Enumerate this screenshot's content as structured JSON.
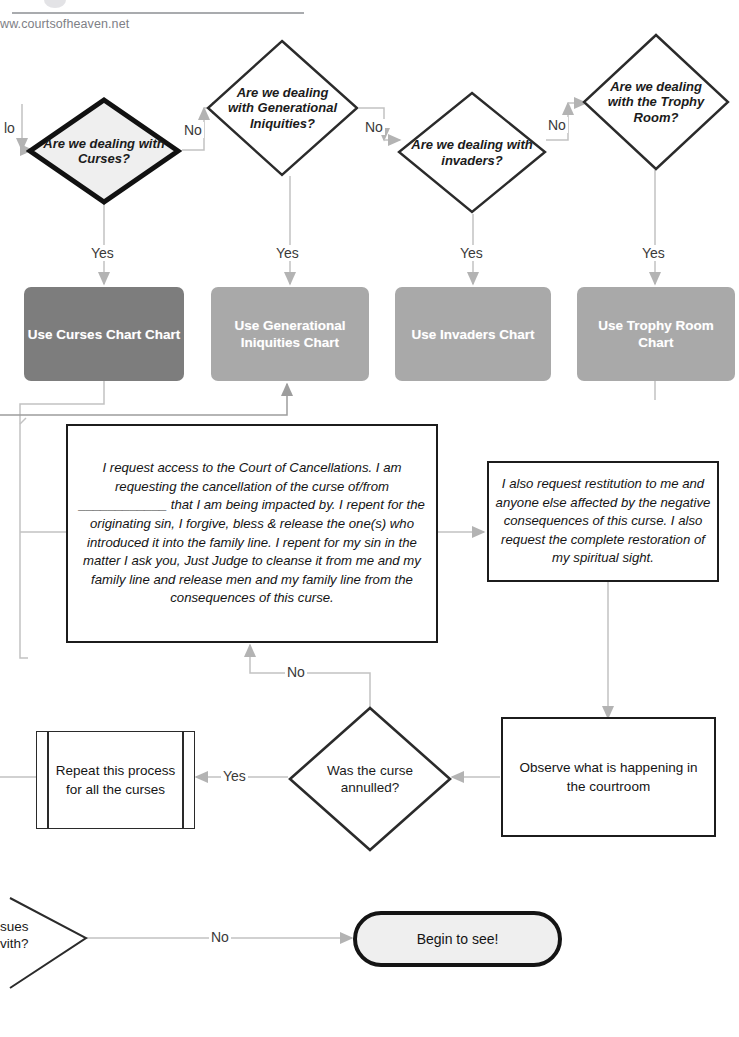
{
  "header": {
    "site_url": "ww.courtsofheaven.net",
    "logo_icon": "circle-logo-icon"
  },
  "decisions": {
    "curses": "Are we dealing with Curses?",
    "generational": "Are we dealing with Generational Iniquities?",
    "invaders": "Are we dealing with invaders?",
    "trophy_room": "Are we dealing with the Trophy Room?",
    "annulled": "Was the curse annulled?",
    "cut_off_left": "sues vith?"
  },
  "chart_boxes": [
    {
      "label": "Use Curses Chart Chart",
      "color": "#7d7d7d"
    },
    {
      "label": "Use Generational Iniquities Chart",
      "color": "#a9a9a9"
    },
    {
      "label": "Use Invaders Chart",
      "color": "#a9a9a9"
    },
    {
      "label": "Use Trophy Room Chart",
      "color": "#a9a9a9"
    }
  ],
  "boxes": {
    "cancellation_prayer": "I request access to the Court of Cancellations. I am requesting the cancellation of the curse of/from ____________ that I am being impacted by. I repent for the originating sin, I forgive, bless & release the one(s) who introduced it into the family line. I repent for my sin in the matter I ask you, Just Judge to cleanse it from me and my family line and release men and my family line from the consequences of this curse.",
    "restitution_prayer": "I also request restitution to me and anyone else affected by the negative consequences of this curse. I also request the complete restoration of my spiritual sight.",
    "repeat_process": "Repeat this process for all the curses",
    "observe": "Observe what is happening in the courtroom",
    "begin_to_see": "Begin to see!"
  },
  "edge_labels": {
    "no_clipped_left": "lo",
    "no_curses_to_generational": "No",
    "no_generational_to_invaders": "No",
    "no_invaders_to_trophy": "No",
    "yes_curses": "Yes",
    "yes_generational": "Yes",
    "yes_invaders": "Yes",
    "yes_trophy": "Yes",
    "no_annulled": "No",
    "yes_annulled": "Yes",
    "no_bottom": "No"
  },
  "colors": {
    "stroke_dark": "#1c1c1c",
    "connector": "#b9b9b9",
    "chart_dark": "#7d7d7d",
    "chart_light": "#a9a9a9",
    "diamond_fill_highlight": "#efefef",
    "page_background": "#ffffff"
  }
}
